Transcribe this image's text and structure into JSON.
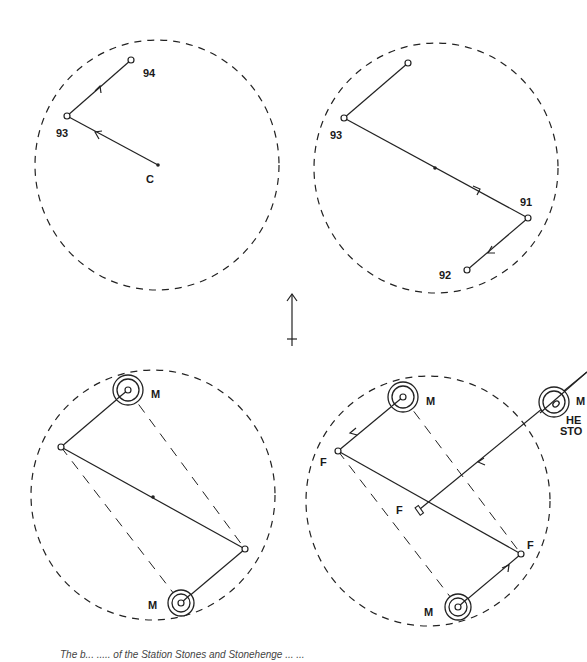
{
  "figure": {
    "panels": [
      {
        "id": "top-left",
        "labels": {
          "a": "94",
          "b": "93",
          "center": "C"
        }
      },
      {
        "id": "top-right",
        "labels": {
          "b": "93",
          "c": "91",
          "d": "92"
        }
      },
      {
        "id": "bottom-left",
        "labels": {
          "m1": "M",
          "m2": "M"
        }
      },
      {
        "id": "bottom-right",
        "labels": {
          "m1": "M",
          "m2": "M",
          "f1": "F",
          "f2": "F",
          "f3": "F",
          "heel_m": "M",
          "heel_line1": "HE",
          "heel_line2": "STO"
        }
      }
    ],
    "north_arrow": "north-arrow",
    "caption": "The b... ..... of the Station Stones and Stonehenge ... ..."
  }
}
